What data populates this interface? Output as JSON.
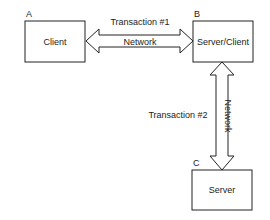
{
  "diagram": {
    "nodes": [
      {
        "id": "A",
        "letter": "A",
        "label": "Client"
      },
      {
        "id": "B",
        "letter": "B",
        "label": "Server/Client"
      },
      {
        "id": "C",
        "letter": "C",
        "label": "Server"
      }
    ],
    "edges": [
      {
        "from": "A",
        "to": "B",
        "transaction_label": "Transaction #1",
        "network_label": "Network",
        "direction": "bidirectional"
      },
      {
        "from": "B",
        "to": "C",
        "transaction_label": "Transaction #2",
        "network_label": "Network",
        "direction": "bidirectional"
      }
    ]
  },
  "colors": {
    "stroke": "#222222",
    "background": "#ffffff"
  }
}
